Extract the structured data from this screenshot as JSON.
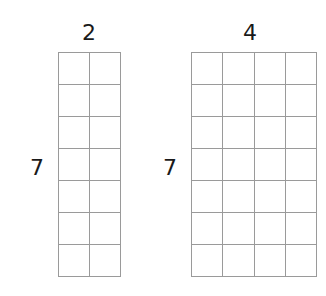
{
  "diagram": {
    "left": {
      "cols": 2,
      "rows": 7,
      "top_label": "2",
      "side_label": "7"
    },
    "right": {
      "cols": 4,
      "rows": 7,
      "top_label": "4",
      "side_label": "7"
    },
    "line_color": "#9a9a9a"
  }
}
